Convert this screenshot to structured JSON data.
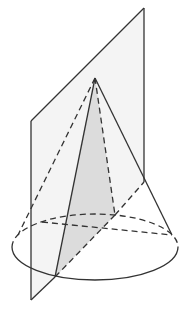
{
  "diagram": {
    "type": "cone-plane-section",
    "colors": {
      "line": "#333333",
      "plane_fill": "#f4f4f4",
      "section_fill": "#dcdcdc",
      "background": "#ffffff"
    }
  }
}
